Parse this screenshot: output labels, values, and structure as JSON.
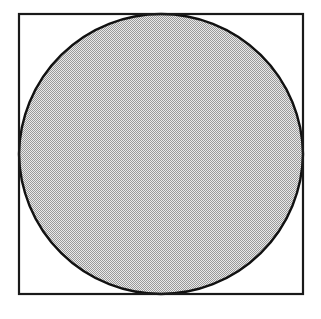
{
  "figure": {
    "caption": "",
    "background_color": "#ffffff",
    "canvas": {
      "width": 321,
      "height": 319
    },
    "square_frame": {
      "name": "bounding-square",
      "x": 19,
      "y": 14,
      "width": 284,
      "height": 280,
      "stroke_color": "#1a1a1a",
      "stroke_width": 2.2,
      "fill": "none"
    },
    "shaded_region": {
      "name": "ogee-shaded-region",
      "description": "Region bounded by four equal circular arcs centered at the corners of the square, forming cusps at the top and bottom midpoints and meeting the square at the left and right midpoints.",
      "fill_pattern": "checkerboard-dither",
      "fill_color": "#c8c8c8",
      "pattern_dot_color": "#8a8a8a",
      "pattern_background_color": "#e8e8e8",
      "stroke_color": "#111111",
      "stroke_width": 2.4,
      "cusps": [
        {
          "label": "top-cusp",
          "x": 161,
          "y": 14
        },
        {
          "label": "bottom-cusp",
          "x": 161,
          "y": 294
        }
      ],
      "tangent_points": [
        {
          "label": "left-contact",
          "x": 19,
          "y": 154
        },
        {
          "label": "right-contact",
          "x": 303,
          "y": 154
        }
      ],
      "arc_radius": 142,
      "arc_centers": [
        {
          "label": "top-left-corner",
          "x": 19,
          "y": 14
        },
        {
          "label": "top-right-corner",
          "x": 303,
          "y": 14
        },
        {
          "label": "bottom-right-corner",
          "x": 303,
          "y": 294
        },
        {
          "label": "bottom-left-corner",
          "x": 19,
          "y": 294
        }
      ],
      "path": "M 161 14 C 161 60 140 88 105 101 C 71 114 19 110 19 154 C 19 198 71 194 105 207 C 140 220 161 248 161 294 C 161 248 182 220 217 207 C 251 194 303 198 303 154 C 303 110 251 114 217 101 C 182 88 161 60 161 14 Z"
    }
  },
  "chart_data": {
    "type": "diagram",
    "title": "",
    "shapes": [
      {
        "name": "square",
        "role": "outer-boundary",
        "corners": [
          [
            19,
            14
          ],
          [
            303,
            14
          ],
          [
            303,
            294
          ],
          [
            19,
            294
          ]
        ],
        "side_length": 284,
        "stroke": "#1a1a1a",
        "fill": "none"
      },
      {
        "name": "ogee-region",
        "role": "shaded-area",
        "construction": "four circular arcs of radius equal to half the square's side, centered at the four corners of the square",
        "arc_radius": 142,
        "cusp_points": [
          [
            161,
            14
          ],
          [
            161,
            294
          ]
        ],
        "tangent_points": [
          [
            19,
            154
          ],
          [
            303,
            154
          ]
        ],
        "fill": "#c8c8c8",
        "stroke": "#111111"
      }
    ],
    "labels": [],
    "legend": [],
    "grid": false
  }
}
